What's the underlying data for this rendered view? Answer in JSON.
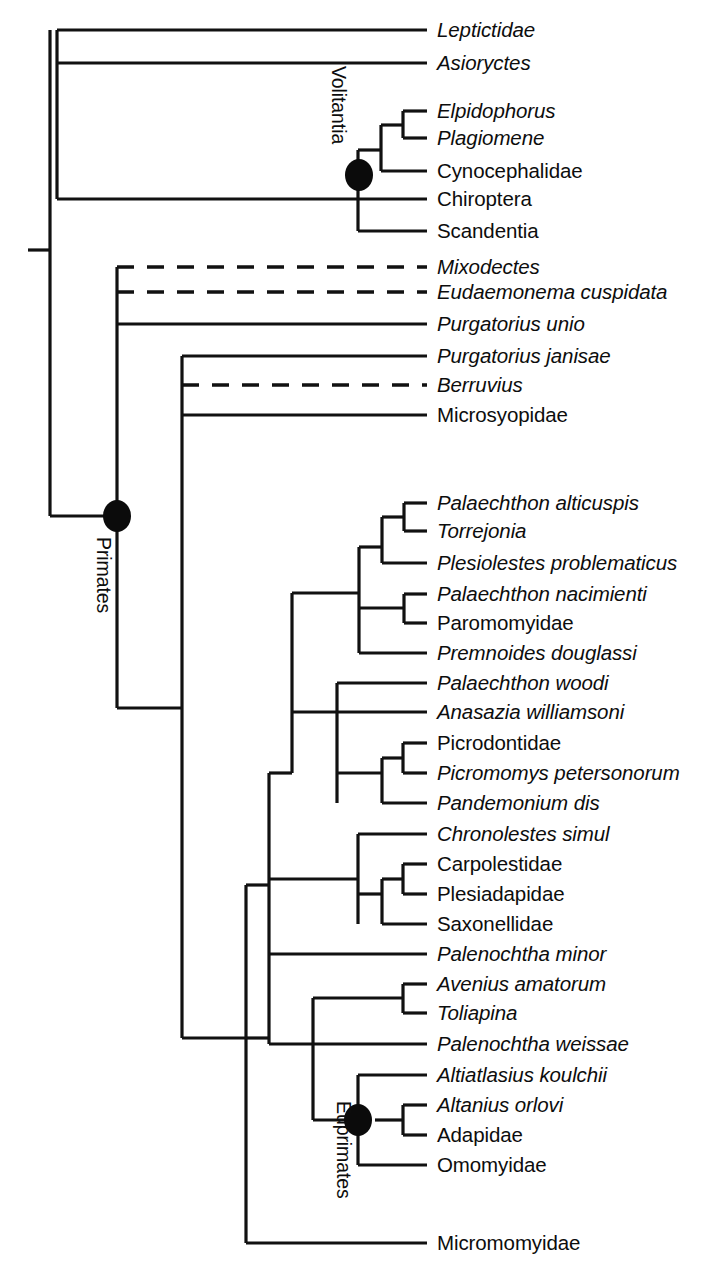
{
  "figure": {
    "type": "cladogram",
    "orientation": "left-to-right",
    "background_color": "#ffffff",
    "line_color": "#111111",
    "node_marker_color": "#0b0b0b",
    "root_x": 50,
    "tip_x": 427,
    "label_x": 437
  },
  "clade_labels": [
    {
      "id": "volitantia",
      "text": "Volitantia",
      "x": 348,
      "y": 66
    },
    {
      "id": "primates",
      "text": "Primates",
      "x": 113,
      "y": 537
    },
    {
      "id": "euprimates",
      "text": "Euprimates",
      "x": 353,
      "y": 1101
    }
  ],
  "node_markers": [
    {
      "id": "volitantia-node",
      "x": 359,
      "y": 175,
      "rx": 14,
      "ry": 16
    },
    {
      "id": "primates-node",
      "x": 117,
      "y": 516,
      "rx": 14,
      "ry": 16
    },
    {
      "id": "euprimates-node",
      "x": 358,
      "y": 1120,
      "rx": 14,
      "ry": 16
    }
  ],
  "taxa": [
    {
      "id": "leptictidae",
      "label": "Leptictidae",
      "y": 30,
      "italic": true,
      "dashed": false,
      "branch_x": 57
    },
    {
      "id": "asioryctes",
      "label": "Asioryctes",
      "y": 63,
      "italic": true,
      "dashed": false,
      "branch_x": 57
    },
    {
      "id": "elpidophorus",
      "label": "Elpidophorus",
      "y": 111,
      "italic": true,
      "dashed": false,
      "branch_x": 403
    },
    {
      "id": "plagiomene",
      "label": "Plagiomene",
      "y": 138,
      "italic": true,
      "dashed": false,
      "branch_x": 403
    },
    {
      "id": "cynocephalidae",
      "label": "Cynocephalidae",
      "y": 171,
      "italic": false,
      "dashed": false,
      "branch_x": 381
    },
    {
      "id": "chiroptera",
      "label": "Chiroptera",
      "y": 199,
      "italic": false,
      "dashed": false,
      "branch_x": 57
    },
    {
      "id": "scandentia",
      "label": "Scandentia",
      "y": 231,
      "italic": false,
      "dashed": false,
      "branch_x": 358
    },
    {
      "id": "mixodectes",
      "label": "Mixodectes",
      "y": 267,
      "italic": true,
      "dashed": true,
      "branch_x": 117
    },
    {
      "id": "eudaemonema-cuspidata",
      "label": "Eudaemonema cuspidata",
      "y": 292,
      "italic": true,
      "dashed": true,
      "branch_x": 117
    },
    {
      "id": "purgatorius-unio",
      "label": "Purgatorius unio",
      "y": 324,
      "italic": true,
      "dashed": false,
      "branch_x": 117
    },
    {
      "id": "purgatorius-janisae",
      "label": "Purgatorius janisae",
      "y": 356,
      "italic": true,
      "dashed": false,
      "branch_x": 182
    },
    {
      "id": "berruvius",
      "label": "Berruvius",
      "y": 385,
      "italic": true,
      "dashed": true,
      "branch_x": 182
    },
    {
      "id": "microsyopidae",
      "label": "Microsyopidae",
      "y": 415,
      "italic": false,
      "dashed": false,
      "branch_x": 182
    },
    {
      "id": "palaechthon-alticuspis",
      "label": "Palaechthon alticuspis",
      "y": 503,
      "italic": true,
      "dashed": false,
      "branch_x": 404
    },
    {
      "id": "torrejonia",
      "label": "Torrejonia",
      "y": 531,
      "italic": true,
      "dashed": false,
      "branch_x": 404
    },
    {
      "id": "plesiolestes-problematicus",
      "label": "Plesiolestes problematicus",
      "y": 563,
      "italic": true,
      "dashed": false,
      "branch_x": 382
    },
    {
      "id": "palaechthon-nacimienti",
      "label": "Palaechthon nacimienti",
      "y": 594,
      "italic": true,
      "dashed": false,
      "branch_x": 404
    },
    {
      "id": "paromomyidae",
      "label": "Paromomyidae",
      "y": 623,
      "italic": false,
      "dashed": false,
      "branch_x": 404
    },
    {
      "id": "premnoides-douglassi",
      "label": "Premnoides douglassi",
      "y": 653,
      "italic": true,
      "dashed": false,
      "branch_x": 359
    },
    {
      "id": "palaechthon-woodi",
      "label": "Palaechthon woodi",
      "y": 683,
      "italic": true,
      "dashed": false,
      "branch_x": 337
    },
    {
      "id": "anasazia-williamsoni",
      "label": "Anasazia williamsoni",
      "y": 712,
      "italic": true,
      "dashed": false,
      "branch_x": 337
    },
    {
      "id": "picrodontidae",
      "label": "Picrodontidae",
      "y": 743,
      "italic": false,
      "dashed": false,
      "branch_x": 403
    },
    {
      "id": "picromomys-petersonorum",
      "label": "Picromomys petersonorum",
      "y": 773,
      "italic": true,
      "dashed": false,
      "branch_x": 403
    },
    {
      "id": "pandemonium-dis",
      "label": "Pandemonium dis",
      "y": 803,
      "italic": true,
      "dashed": false,
      "branch_x": 382
    },
    {
      "id": "chronolestes-simul",
      "label": "Chronolestes simul",
      "y": 834,
      "italic": true,
      "dashed": false,
      "branch_x": 358
    },
    {
      "id": "carpolestidae",
      "label": "Carpolestidae",
      "y": 864,
      "italic": false,
      "dashed": false,
      "branch_x": 403
    },
    {
      "id": "plesiadapidae",
      "label": "Plesiadapidae",
      "y": 894,
      "italic": false,
      "dashed": false,
      "branch_x": 403
    },
    {
      "id": "saxonellidae",
      "label": "Saxonellidae",
      "y": 924,
      "italic": false,
      "dashed": false,
      "branch_x": 382
    },
    {
      "id": "palenochtha-minor",
      "label": "Palenochtha minor",
      "y": 954,
      "italic": true,
      "dashed": false,
      "branch_x": 269
    },
    {
      "id": "avenius-amatorum",
      "label": "Avenius amatorum",
      "y": 984,
      "italic": true,
      "dashed": false,
      "branch_x": 403
    },
    {
      "id": "toliapina",
      "label": "Toliapina",
      "y": 1013,
      "italic": true,
      "dashed": false,
      "branch_x": 403
    },
    {
      "id": "palenochtha-weissae",
      "label": "Palenochtha weissae",
      "y": 1044,
      "italic": true,
      "dashed": false,
      "branch_x": 313
    },
    {
      "id": "altiatlasius-koulchii",
      "label": "Altiatlasius koulchii",
      "y": 1075,
      "italic": true,
      "dashed": false,
      "branch_x": 358
    },
    {
      "id": "altanius-orlovi",
      "label": "Altanius orlovi",
      "y": 1105,
      "italic": true,
      "dashed": false,
      "branch_x": 403
    },
    {
      "id": "adapidae",
      "label": "Adapidae",
      "y": 1135,
      "italic": false,
      "dashed": false,
      "branch_x": 403
    },
    {
      "id": "omomyidae",
      "label": "Omomyidae",
      "y": 1165,
      "italic": false,
      "dashed": false,
      "branch_x": 358
    },
    {
      "id": "micromomyidae",
      "label": "Micromomyidae",
      "y": 1243,
      "italic": false,
      "dashed": false,
      "branch_x": 246
    }
  ],
  "internal_branches": [
    {
      "id": "root-stub",
      "x1": 28,
      "y1": 250,
      "x2": 50,
      "y2": 250
    },
    {
      "id": "root-vertical",
      "x1": 50,
      "y1": 30,
      "x2": 50,
      "y2": 516
    },
    {
      "id": "outgroup-vertical",
      "x1": 57,
      "y1": 30,
      "x2": 57,
      "y2": 199
    },
    {
      "id": "volitantia-stem",
      "x1": 50,
      "y1": 516,
      "x2": 117,
      "y2": 516
    },
    {
      "id": "scandentia-stem",
      "x1": 358,
      "y1": 199,
      "x2": 358,
      "y2": 231
    },
    {
      "id": "dermoptera-chiro-v",
      "x1": 358,
      "y1": 150,
      "x2": 358,
      "y2": 199
    },
    {
      "id": "dermoptera-stem",
      "x1": 358,
      "y1": 150,
      "x2": 381,
      "y2": 150
    },
    {
      "id": "dermoptera-vertical",
      "x1": 381,
      "y1": 125,
      "x2": 381,
      "y2": 171
    },
    {
      "id": "elp-plag-stem",
      "x1": 381,
      "y1": 125,
      "x2": 403,
      "y2": 125
    },
    {
      "id": "elp-plag-vertical",
      "x1": 403,
      "y1": 111,
      "x2": 403,
      "y2": 138
    },
    {
      "id": "primates-vertical",
      "x1": 117,
      "y1": 267,
      "x2": 117,
      "y2": 516
    },
    {
      "id": "primates-inner-stem",
      "x1": 117,
      "y1": 708,
      "x2": 182,
      "y2": 708
    },
    {
      "id": "primates-inner-v",
      "x1": 117,
      "y1": 516,
      "x2": 117,
      "y2": 708
    },
    {
      "id": "microsyopid-vertical",
      "x1": 182,
      "y1": 356,
      "x2": 182,
      "y2": 1038
    },
    {
      "id": "big-clade-stem",
      "x1": 182,
      "y1": 1038,
      "x2": 246,
      "y2": 1038
    },
    {
      "id": "plesiadapiform-v",
      "x1": 246,
      "y1": 885,
      "x2": 246,
      "y2": 1243
    },
    {
      "id": "plesiad-stem",
      "x1": 246,
      "y1": 885,
      "x2": 269,
      "y2": 885
    },
    {
      "id": "plesiad-vertical",
      "x1": 269,
      "y1": 773,
      "x2": 269,
      "y2": 1038
    },
    {
      "id": "paleo-group-stem",
      "x1": 269,
      "y1": 773,
      "x2": 292,
      "y2": 773
    },
    {
      "id": "paleo-group-vertical",
      "x1": 292,
      "y1": 593,
      "x2": 292,
      "y2": 773
    },
    {
      "id": "paleo-upper-stem",
      "x1": 292,
      "y1": 593,
      "x2": 359,
      "y2": 593
    },
    {
      "id": "paleo-upper-vertical",
      "x1": 359,
      "y1": 547,
      "x2": 359,
      "y2": 653
    },
    {
      "id": "paleo-top-stem",
      "x1": 359,
      "y1": 547,
      "x2": 382,
      "y2": 547
    },
    {
      "id": "paleo-top-vertical",
      "x1": 382,
      "y1": 517,
      "x2": 382,
      "y2": 563
    },
    {
      "id": "paleo-pair-stem",
      "x1": 382,
      "y1": 517,
      "x2": 404,
      "y2": 517
    },
    {
      "id": "paleo-pair-vertical",
      "x1": 404,
      "y1": 503,
      "x2": 404,
      "y2": 531
    },
    {
      "id": "nacimienti-v",
      "x1": 359,
      "y1": 608,
      "x2": 359,
      "y2": 608
    },
    {
      "id": "nacim-parom-stem",
      "x1": 359,
      "y1": 608,
      "x2": 404,
      "y2": 608
    },
    {
      "id": "nacim-parom-vertical",
      "x1": 404,
      "y1": 594,
      "x2": 404,
      "y2": 623
    },
    {
      "id": "picro-group-stem",
      "x1": 292,
      "y1": 712,
      "x2": 337,
      "y2": 712
    },
    {
      "id": "picro-group-vertical",
      "x1": 337,
      "y1": 683,
      "x2": 337,
      "y2": 803
    },
    {
      "id": "picro-inner-stem",
      "x1": 337,
      "y1": 773,
      "x2": 382,
      "y2": 773
    },
    {
      "id": "picro-inner-vertical",
      "x1": 382,
      "y1": 758,
      "x2": 382,
      "y2": 803
    },
    {
      "id": "picro-pair-stem",
      "x1": 382,
      "y1": 758,
      "x2": 403,
      "y2": 758
    },
    {
      "id": "picro-pair-vertical",
      "x1": 403,
      "y1": 743,
      "x2": 403,
      "y2": 773
    },
    {
      "id": "carpo-group-stem",
      "x1": 269,
      "y1": 879,
      "x2": 358,
      "y2": 879
    },
    {
      "id": "carpo-group-vertical",
      "x1": 358,
      "y1": 834,
      "x2": 358,
      "y2": 924
    },
    {
      "id": "carpo-inner-stem",
      "x1": 358,
      "y1": 894,
      "x2": 382,
      "y2": 894
    },
    {
      "id": "carpo-inner-vertical",
      "x1": 382,
      "y1": 879,
      "x2": 382,
      "y2": 924
    },
    {
      "id": "carpo-pair-stem",
      "x1": 382,
      "y1": 879,
      "x2": 403,
      "y2": 879
    },
    {
      "id": "carpo-pair-vertical",
      "x1": 403,
      "y1": 864,
      "x2": 403,
      "y2": 894
    },
    {
      "id": "euprim-group-stem",
      "x1": 246,
      "y1": 1038,
      "x2": 269,
      "y2": 1038
    },
    {
      "id": "euprim-group-vertical",
      "x1": 269,
      "y1": 1038,
      "x2": 269,
      "y2": 1044
    },
    {
      "id": "euprim-top-stem",
      "x1": 269,
      "y1": 1044,
      "x2": 313,
      "y2": 1044
    },
    {
      "id": "euprim-top-vertical",
      "x1": 313,
      "y1": 998,
      "x2": 313,
      "y2": 1120
    },
    {
      "id": "avenius-stem",
      "x1": 313,
      "y1": 998,
      "x2": 403,
      "y2": 998
    },
    {
      "id": "avenius-vertical",
      "x1": 403,
      "y1": 984,
      "x2": 403,
      "y2": 1013
    },
    {
      "id": "euprimates-stem",
      "x1": 313,
      "y1": 1120,
      "x2": 358,
      "y2": 1120
    },
    {
      "id": "euprimates-vertical",
      "x1": 358,
      "y1": 1075,
      "x2": 358,
      "y2": 1165
    },
    {
      "id": "altanius-stem",
      "x1": 375,
      "y1": 1120,
      "x2": 403,
      "y2": 1120
    },
    {
      "id": "altanius-vertical",
      "x1": 403,
      "y1": 1105,
      "x2": 403,
      "y2": 1135
    }
  ]
}
